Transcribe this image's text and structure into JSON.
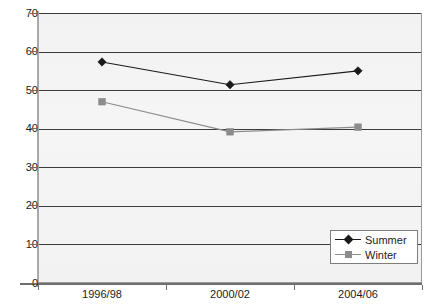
{
  "chart_data": {
    "type": "line",
    "title": "",
    "xlabel": "",
    "ylabel": "",
    "categories": [
      "1996/98",
      "2000/02",
      "2004/06"
    ],
    "ylim": [
      0,
      70
    ],
    "yticks": [
      0,
      10,
      20,
      30,
      40,
      50,
      60,
      70
    ],
    "ytick_labels": [
      "0",
      "10",
      "20",
      "30",
      "40",
      "50",
      "60",
      "70"
    ],
    "grid": true,
    "legend_position": "bottom-right",
    "series": [
      {
        "name": "Summer",
        "values": [
          57.3,
          51.4,
          55.0
        ],
        "color": "#1a1a1a",
        "marker": "diamond"
      },
      {
        "name": "Winter",
        "values": [
          47.0,
          39.2,
          40.4
        ],
        "color": "#8c8c8c",
        "marker": "square"
      }
    ]
  },
  "legend": {
    "entries": [
      {
        "label": "Summer",
        "marker_name": "diamond-marker-icon"
      },
      {
        "label": "Winter",
        "marker_name": "square-marker-icon"
      }
    ]
  },
  "colors": {
    "plot_background": "#e9e9e9",
    "gridline": "#3c3c3c",
    "axis": "#6e6e6e",
    "summer": "#1a1a1a",
    "winter": "#8c8c8c",
    "text": "#1a1a1a",
    "legend_background": "#ffffff",
    "legend_border": "#7d7d7d"
  },
  "title_sliver": ""
}
